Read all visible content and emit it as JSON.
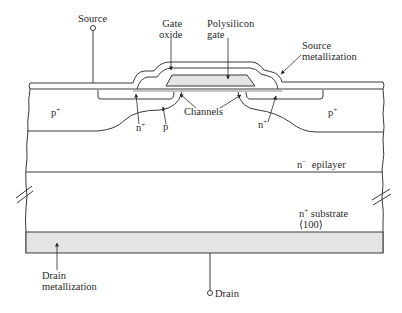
{
  "diagram": {
    "type": "cross-section",
    "colors": {
      "line": "#3a3a3a",
      "fill_shaded": "#e4e4e4",
      "background": "#ffffff"
    },
    "labels": {
      "source": "Source",
      "gate_oxide_line1": "Gate",
      "gate_oxide_line2": "oxide",
      "poly_gate_line1": "Polysilicon",
      "poly_gate_line2": "gate",
      "source_metal_line1": "Source",
      "source_metal_line2": "metallization",
      "p_plus_left": "p",
      "p_plus_left_sup": "+",
      "p_plus_right": "p",
      "p_plus_right_sup": "+",
      "n_plus_left": "n",
      "n_plus_left_sup": "+",
      "n_plus_right": "n",
      "n_plus_right_sup": "+",
      "p_body": "p",
      "channels": "Channels",
      "epilayer_n": "n",
      "epilayer_sup": "−",
      "epilayer_text": "epilayer",
      "substrate_n": "n",
      "substrate_sup": "+",
      "substrate_text": "substrate",
      "substrate_orientation": "⟨100⟩",
      "drain_metal_line1": "Drain",
      "drain_metal_line2": "metallization",
      "drain": "Drain"
    },
    "terminals": [
      {
        "name": "Source",
        "position": "top"
      },
      {
        "name": "Drain",
        "position": "bottom"
      }
    ],
    "layers_top_to_bottom": [
      "Source metallization",
      "Gate oxide",
      "Polysilicon gate",
      "n+ source / p body / p+ regions",
      "n− epilayer",
      "n+ substrate ⟨100⟩",
      "Drain metallization"
    ]
  }
}
